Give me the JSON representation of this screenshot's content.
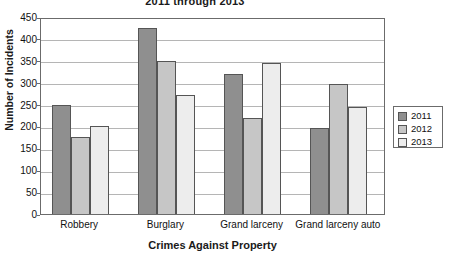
{
  "chart_data": {
    "type": "bar",
    "title": "2011 through 2013",
    "xlabel": "Crimes Against Property",
    "ylabel": "Number of Incidents",
    "categories": [
      "Robbery",
      "Burglary",
      "Grand larceny",
      "Grand larceny auto"
    ],
    "series": [
      {
        "name": "2011",
        "color": "#8f8f8f",
        "values": [
          250,
          425,
          320,
          196
        ]
      },
      {
        "name": "2012",
        "color": "#c6c6c6",
        "values": [
          175,
          350,
          220,
          297
        ]
      },
      {
        "name": "2013",
        "color": "#ededed",
        "values": [
          200,
          272,
          345,
          245
        ]
      }
    ],
    "ylim": [
      0,
      450
    ],
    "ytick_labels": [
      "450",
      "400",
      "350",
      "300",
      "250",
      "200",
      "150",
      "100",
      "50",
      "0"
    ],
    "ytick_values": [
      450,
      400,
      350,
      300,
      250,
      200,
      150,
      100,
      50,
      0
    ],
    "grid": true,
    "legend_position": "right"
  }
}
